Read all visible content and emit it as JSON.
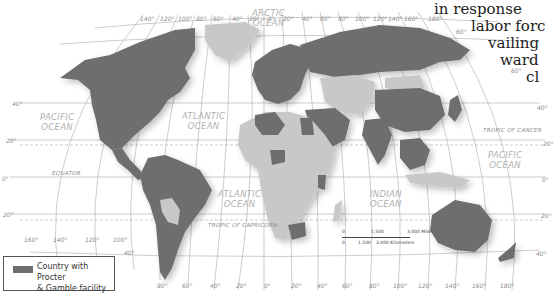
{
  "prose_lines": [
    "in response",
    "labor forc",
    "vailing",
    "ward",
    "cl"
  ],
  "legend": {
    "label_line1": "Country with Procter",
    "label_line2": "& Gamble facility",
    "swatch_color": "#6e6e6e"
  },
  "colors": {
    "facility_country": "#6e6e6e",
    "other_land": "#c8c8c8",
    "ocean": "#ffffff",
    "graticule": "#9a9a9a"
  },
  "oceans": [
    {
      "line1": "ARCTIC",
      "line2": "OCEAN"
    },
    {
      "line1": "PACIFIC",
      "line2": "OCEAN"
    },
    {
      "line1": "ATLANTIC",
      "line2": "OCEAN"
    },
    {
      "line1": "ATLANTIC",
      "line2": "OCEAN"
    },
    {
      "line1": "INDIAN",
      "line2": "OCEAN"
    },
    {
      "line1": "PACIFIC",
      "line2": "OCEAN"
    }
  ],
  "reference_lines": {
    "tropic_of_cancer": "TROPIC OF CANCER",
    "equator": "EQUATOR",
    "tropic_of_capricorn": "TROPIC OF CAPRICORN"
  },
  "longitude_top": [
    "140°",
    "120°",
    "100°",
    "80°",
    "60°",
    "40°",
    "20°",
    "0°",
    "20°",
    "40°",
    "60°",
    "80°",
    "100°",
    "120°",
    "140°",
    "160°",
    "180°"
  ],
  "longitude_bottom": [
    "160°",
    "140°",
    "120°",
    "100°",
    "80°",
    "60°",
    "40°",
    "20°",
    "0°",
    "20°",
    "40°",
    "60°",
    "80°",
    "100°",
    "120°",
    "140°",
    "160°",
    "180°"
  ],
  "latitude_left": [
    "40°",
    "20°",
    "0°",
    "20°",
    "40°"
  ],
  "latitude_right": [
    "60°",
    "60°",
    "40°",
    "20°",
    "0°",
    "20°",
    "40°"
  ],
  "scale_bar": {
    "miles_0": "0",
    "miles_1500": "1,500",
    "miles_3000": "3,000 Miles",
    "km_0": "0",
    "km_1500": "1,500",
    "km_3000": "3,000 Kilometers"
  }
}
